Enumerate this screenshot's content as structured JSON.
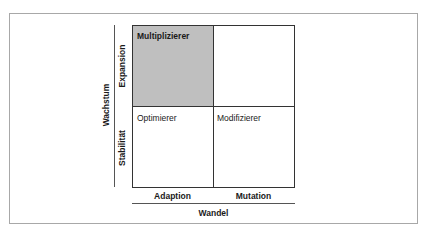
{
  "diagram": {
    "quadrants": [
      {
        "position": "top-left",
        "label": "Multiplizierer",
        "highlighted": true
      },
      {
        "position": "top-right",
        "label": "",
        "highlighted": false
      },
      {
        "position": "bottom-left",
        "label": "Optimierer",
        "highlighted": false
      },
      {
        "position": "bottom-right",
        "label": "Modifizierer",
        "highlighted": false
      }
    ],
    "y_axis": {
      "title": "Wachstum",
      "categories": [
        "Expansion",
        "Stabilität"
      ]
    },
    "x_axis": {
      "title": "Wandel",
      "categories": [
        "Adaption",
        "Mutation"
      ]
    },
    "colors": {
      "highlight": "#bfbfbf",
      "lines": "#333333",
      "frame": "#a8a8a8"
    }
  }
}
